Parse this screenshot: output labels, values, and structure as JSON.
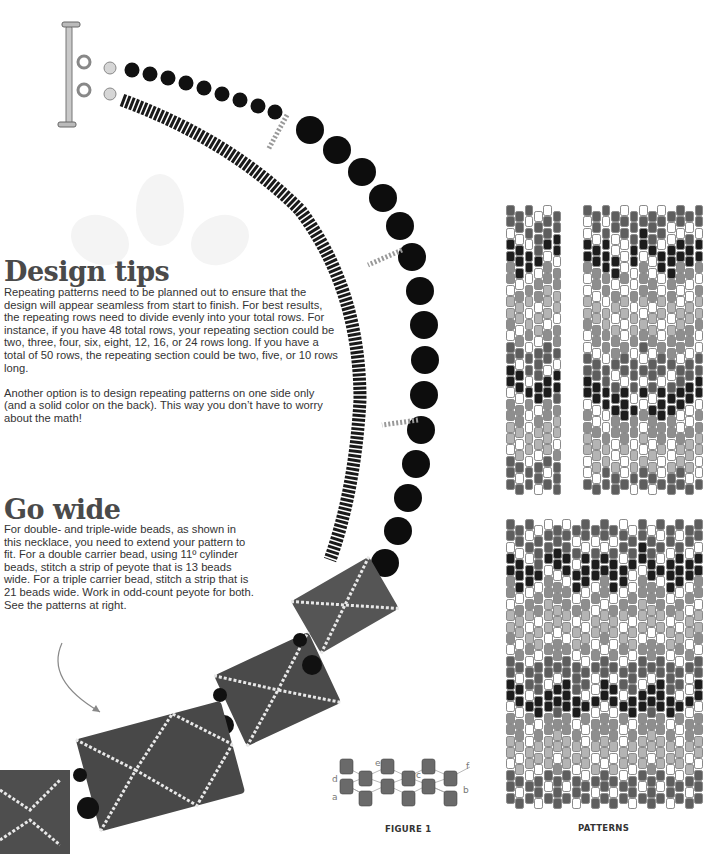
{
  "design_tips": {
    "heading": "Design tips",
    "paragraphs": [
      "Repeating patterns need to be planned out to ensure that the design will appear seamless from start to finish. For best results, the repeating rows need to divide evenly into your total rows. For instance, if you have 48 total rows, your repeating section could be two, three, four, six, eight, 12, 16, or 24 rows long. If you have a total of 50 rows, the repeating section could be two, five, or 10 rows long.",
      "Another option is to design repeating patterns on one side only (and a solid color on the back). This way you don’t have to worry about the math!"
    ]
  },
  "go_wide": {
    "heading": "Go wide",
    "paragraph": "For double- and triple-wide beads, as shown in this necklace, you need to extend your pattern to fit. For a double carrier bead, using 11º cylinder beads, stitch a strip of peyote that is 13 beads wide. For a triple carrier bead, stitch a strip that is 21 beads wide. Work in odd-count peyote for both. See the patterns at right."
  },
  "figure1": {
    "caption": "FIGURE 1",
    "point_labels": [
      "a",
      "b",
      "c",
      "d",
      "e",
      "f"
    ]
  },
  "patterns": {
    "caption": "PATTERNS",
    "colors": {
      "0": "#ffffff",
      "1": "#b4b4b4",
      "2": "#8e8e8e",
      "3": "#5e5e5e",
      "4": "#1c1c1c"
    },
    "single": {
      "columns": 6,
      "rows": [
        [
          3,
          3,
          3,
          0,
          0,
          3
        ],
        [
          3,
          3,
          0,
          3,
          3,
          3
        ],
        [
          0,
          0,
          3,
          3,
          3,
          4
        ],
        [
          4,
          4,
          0,
          3,
          4,
          4
        ],
        [
          4,
          4,
          4,
          4,
          0,
          0
        ],
        [
          2,
          4,
          4,
          0,
          2,
          2
        ],
        [
          2,
          0,
          0,
          2,
          2,
          2
        ],
        [
          0,
          2,
          2,
          2,
          1,
          1
        ],
        [
          1,
          1,
          1,
          0,
          1,
          1
        ],
        [
          1,
          1,
          0,
          1,
          1,
          0
        ],
        [
          2,
          0,
          1,
          1,
          0,
          2
        ],
        [
          0,
          2,
          2,
          0,
          2,
          2
        ],
        [
          3,
          3,
          0,
          3,
          3,
          3
        ],
        [
          3,
          0,
          3,
          3,
          3,
          0
        ],
        [
          4,
          4,
          3,
          3,
          0,
          4
        ],
        [
          4,
          4,
          0,
          4,
          4,
          4
        ],
        [
          0,
          0,
          4,
          4,
          4,
          3
        ],
        [
          2,
          2,
          2,
          0,
          2,
          2
        ],
        [
          2,
          2,
          0,
          2,
          2,
          1
        ],
        [
          1,
          1,
          0,
          1,
          1,
          1
        ],
        [
          1,
          0,
          1,
          1,
          1,
          0
        ],
        [
          0,
          1,
          1,
          0,
          1,
          2
        ],
        [
          3,
          3,
          0,
          3,
          3,
          3
        ],
        [
          3,
          0,
          3,
          3,
          0,
          3
        ],
        [
          3,
          3,
          3,
          0,
          3,
          3
        ]
      ]
    },
    "double": {
      "columns": 13,
      "rows": [
        [
          3,
          3,
          3,
          3,
          0,
          3,
          0,
          3,
          0,
          3,
          3,
          3,
          3
        ],
        [
          0,
          3,
          0,
          3,
          3,
          3,
          3,
          3,
          3,
          0,
          3,
          0,
          3
        ],
        [
          0,
          0,
          3,
          0,
          3,
          3,
          4,
          3,
          3,
          0,
          0,
          3,
          0
        ],
        [
          4,
          4,
          4,
          0,
          0,
          4,
          4,
          4,
          0,
          4,
          4,
          4,
          4
        ],
        [
          4,
          4,
          4,
          4,
          0,
          4,
          0,
          0,
          4,
          4,
          4,
          4,
          4
        ],
        [
          2,
          2,
          4,
          4,
          0,
          0,
          2,
          0,
          4,
          4,
          2,
          2,
          2
        ],
        [
          0,
          2,
          2,
          0,
          2,
          0,
          2,
          2,
          0,
          2,
          2,
          0,
          0
        ],
        [
          0,
          0,
          2,
          2,
          0,
          2,
          2,
          2,
          0,
          2,
          0,
          0,
          2
        ],
        [
          1,
          1,
          0,
          1,
          1,
          0,
          1,
          0,
          1,
          1,
          0,
          1,
          1
        ],
        [
          1,
          1,
          1,
          0,
          1,
          1,
          0,
          1,
          1,
          0,
          1,
          1,
          1
        ],
        [
          2,
          2,
          1,
          1,
          0,
          1,
          1,
          1,
          0,
          1,
          1,
          2,
          2
        ],
        [
          0,
          2,
          2,
          2,
          0,
          2,
          2,
          2,
          0,
          2,
          2,
          2,
          0
        ],
        [
          0,
          0,
          2,
          2,
          2,
          0,
          3,
          0,
          2,
          2,
          2,
          0,
          0
        ],
        [
          3,
          3,
          0,
          3,
          3,
          3,
          0,
          3,
          3,
          3,
          0,
          3,
          3
        ],
        [
          3,
          3,
          3,
          0,
          3,
          3,
          3,
          3,
          3,
          0,
          3,
          3,
          3
        ],
        [
          4,
          4,
          3,
          3,
          0,
          3,
          0,
          3,
          0,
          3,
          3,
          4,
          4
        ],
        [
          4,
          4,
          4,
          4,
          4,
          0,
          4,
          0,
          4,
          4,
          4,
          4,
          4
        ],
        [
          0,
          0,
          4,
          4,
          4,
          4,
          0,
          4,
          4,
          4,
          4,
          0,
          0
        ],
        [
          2,
          0,
          0,
          2,
          4,
          2,
          2,
          2,
          4,
          2,
          0,
          0,
          2
        ],
        [
          2,
          2,
          0,
          2,
          2,
          2,
          0,
          2,
          2,
          2,
          0,
          2,
          2
        ],
        [
          1,
          1,
          2,
          0,
          2,
          0,
          1,
          0,
          2,
          0,
          2,
          1,
          1
        ],
        [
          1,
          1,
          1,
          0,
          1,
          1,
          0,
          1,
          1,
          0,
          1,
          1,
          1
        ],
        [
          0,
          1,
          1,
          1,
          0,
          1,
          1,
          1,
          0,
          1,
          1,
          1,
          0
        ],
        [
          0,
          0,
          3,
          3,
          0,
          3,
          3,
          3,
          0,
          3,
          3,
          0,
          0
        ],
        [
          3,
          3,
          3,
          3,
          3,
          0,
          3,
          0,
          3,
          3,
          3,
          3,
          3
        ]
      ]
    },
    "triple": {
      "columns": 21,
      "rows": [
        [
          3,
          3,
          3,
          0,
          0,
          3,
          0,
          3,
          3,
          3,
          3,
          3,
          0,
          0,
          3,
          0,
          3,
          3,
          3,
          3,
          3
        ],
        [
          3,
          3,
          0,
          3,
          3,
          3,
          3,
          0,
          3,
          0,
          3,
          0,
          3,
          3,
          3,
          3,
          0,
          3,
          0,
          3,
          3
        ],
        [
          0,
          0,
          3,
          3,
          3,
          4,
          3,
          3,
          0,
          3,
          0,
          3,
          3,
          3,
          4,
          3,
          3,
          0,
          3,
          0,
          0
        ],
        [
          4,
          4,
          0,
          3,
          4,
          4,
          4,
          0,
          4,
          4,
          4,
          4,
          0,
          4,
          4,
          4,
          0,
          4,
          4,
          4,
          4
        ],
        [
          4,
          4,
          4,
          4,
          0,
          0,
          4,
          4,
          4,
          4,
          4,
          4,
          4,
          0,
          0,
          4,
          4,
          4,
          4,
          4,
          4
        ],
        [
          2,
          4,
          4,
          0,
          2,
          2,
          0,
          4,
          4,
          0,
          2,
          4,
          4,
          0,
          2,
          2,
          0,
          4,
          4,
          0,
          2
        ],
        [
          2,
          0,
          0,
          2,
          2,
          2,
          2,
          0,
          0,
          2,
          2,
          0,
          0,
          2,
          2,
          2,
          2,
          0,
          0,
          2,
          2
        ],
        [
          0,
          2,
          2,
          2,
          1,
          1,
          2,
          2,
          2,
          0,
          0,
          2,
          2,
          2,
          1,
          1,
          2,
          2,
          2,
          0,
          0
        ],
        [
          1,
          1,
          1,
          0,
          1,
          1,
          1,
          0,
          1,
          1,
          1,
          1,
          1,
          0,
          1,
          1,
          1,
          0,
          1,
          1,
          1
        ],
        [
          1,
          1,
          0,
          1,
          1,
          0,
          1,
          1,
          0,
          1,
          1,
          1,
          0,
          1,
          1,
          0,
          1,
          1,
          0,
          1,
          1
        ],
        [
          2,
          0,
          1,
          1,
          0,
          2,
          0,
          1,
          1,
          0,
          2,
          0,
          1,
          1,
          0,
          2,
          0,
          1,
          1,
          0,
          2
        ],
        [
          0,
          2,
          2,
          0,
          2,
          2,
          2,
          0,
          2,
          2,
          0,
          2,
          2,
          0,
          2,
          2,
          2,
          0,
          2,
          2,
          0
        ],
        [
          3,
          3,
          0,
          3,
          3,
          3,
          3,
          3,
          0,
          3,
          3,
          3,
          0,
          3,
          3,
          3,
          3,
          3,
          0,
          3,
          3
        ],
        [
          3,
          0,
          3,
          3,
          3,
          0,
          3,
          3,
          3,
          0,
          3,
          0,
          3,
          3,
          3,
          0,
          3,
          3,
          3,
          0,
          3
        ],
        [
          4,
          4,
          3,
          3,
          0,
          4,
          4,
          3,
          3,
          0,
          4,
          4,
          3,
          3,
          0,
          4,
          4,
          3,
          3,
          0,
          4
        ],
        [
          4,
          4,
          0,
          4,
          4,
          4,
          4,
          4,
          0,
          4,
          4,
          4,
          0,
          4,
          4,
          4,
          4,
          4,
          0,
          4,
          4
        ],
        [
          0,
          0,
          4,
          4,
          4,
          3,
          4,
          4,
          4,
          0,
          0,
          0,
          4,
          4,
          4,
          3,
          4,
          4,
          4,
          0,
          0
        ],
        [
          2,
          2,
          2,
          0,
          2,
          2,
          2,
          0,
          2,
          2,
          2,
          2,
          2,
          0,
          2,
          2,
          2,
          0,
          2,
          2,
          2
        ],
        [
          2,
          2,
          0,
          2,
          2,
          1,
          2,
          2,
          0,
          2,
          2,
          2,
          0,
          2,
          2,
          1,
          2,
          2,
          0,
          2,
          2
        ],
        [
          1,
          1,
          0,
          1,
          1,
          1,
          1,
          1,
          0,
          1,
          1,
          1,
          0,
          1,
          1,
          1,
          1,
          1,
          0,
          1,
          1
        ],
        [
          1,
          0,
          1,
          1,
          1,
          0,
          1,
          1,
          1,
          0,
          1,
          0,
          1,
          1,
          1,
          0,
          1,
          1,
          1,
          0,
          1
        ],
        [
          0,
          1,
          1,
          0,
          1,
          2,
          1,
          0,
          1,
          1,
          0,
          1,
          1,
          0,
          1,
          2,
          1,
          0,
          1,
          1,
          0
        ],
        [
          3,
          3,
          0,
          3,
          3,
          3,
          3,
          3,
          0,
          3,
          3,
          3,
          0,
          3,
          3,
          3,
          3,
          3,
          0,
          3,
          3
        ],
        [
          3,
          0,
          3,
          3,
          0,
          3,
          0,
          3,
          3,
          0,
          3,
          0,
          3,
          3,
          0,
          3,
          0,
          3,
          3,
          0,
          3
        ],
        [
          3,
          3,
          3,
          0,
          3,
          3,
          3,
          0,
          3,
          3,
          3,
          3,
          3,
          0,
          3,
          3,
          3,
          0,
          3,
          3,
          3
        ]
      ]
    }
  }
}
